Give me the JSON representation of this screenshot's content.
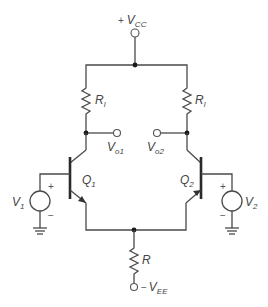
{
  "diagram": {
    "type": "differential-pair-bjt-circuit",
    "supply_positive": {
      "sign": "+",
      "main": "V",
      "sub": "CC"
    },
    "supply_negative": {
      "sign": "−",
      "main": "V",
      "sub": "EE"
    },
    "resistors": {
      "left_load": {
        "main": "R",
        "sub": "l"
      },
      "right_load": {
        "main": "R",
        "sub": "l"
      },
      "tail": {
        "main": "R"
      }
    },
    "transistors": {
      "left": {
        "main": "Q",
        "sub": "1"
      },
      "right": {
        "main": "Q",
        "sub": "2"
      }
    },
    "outputs": {
      "left": {
        "main": "V",
        "sub": "o1"
      },
      "right": {
        "main": "V",
        "sub": "o2"
      }
    },
    "sources": {
      "left": {
        "main": "V",
        "sub": "1",
        "plus": "+",
        "minus": "−"
      },
      "right": {
        "main": "V",
        "sub": "2",
        "plus": "+",
        "minus": "−"
      }
    },
    "colors": {
      "wire": "#4a4a4a",
      "background": "#ffffff"
    }
  }
}
